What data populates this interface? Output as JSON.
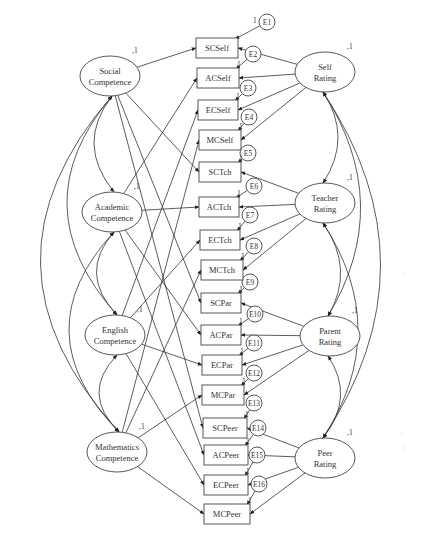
{
  "diagram": {
    "type": "structural-equation-model",
    "latent_left": [
      {
        "id": "SC",
        "line1": "Social",
        "line2": "Competence",
        "variance": ",1",
        "cx": 110,
        "cy": 76
      },
      {
        "id": "AC",
        "line1": "Academic",
        "line2": "Competence",
        "variance": ",1",
        "cx": 112,
        "cy": 212
      },
      {
        "id": "EC",
        "line1": "English",
        "line2": "Competence",
        "variance": ",1",
        "cx": 115,
        "cy": 335
      },
      {
        "id": "MC",
        "line1": "Mathematics",
        "line2": "Competence",
        "variance": ",1",
        "cx": 117,
        "cy": 452
      }
    ],
    "latent_right": [
      {
        "id": "SR",
        "line1": "Self",
        "line2": "Rating",
        "variance": ",1",
        "cx": 325,
        "cy": 72
      },
      {
        "id": "TR",
        "line1": "Teacher",
        "line2": "Rating",
        "variance": ",1",
        "cx": 325,
        "cy": 203
      },
      {
        "id": "PR",
        "line1": "Parent",
        "line2": "Rating",
        "variance": ",1",
        "cx": 330,
        "cy": 336
      },
      {
        "id": "PE",
        "line1": "Peer",
        "line2": "Rating",
        "variance": ",1",
        "cx": 325,
        "cy": 458
      }
    ],
    "indicators": [
      {
        "label": "SCSelf",
        "error": "E1",
        "trait": 0,
        "method": 0
      },
      {
        "label": "ACSelf",
        "error": "E2",
        "trait": 1,
        "method": 0
      },
      {
        "label": "ECSelf",
        "error": "E3",
        "trait": 2,
        "method": 0
      },
      {
        "label": "MCSelf",
        "error": "E4",
        "trait": 3,
        "method": 0
      },
      {
        "label": "SCTch",
        "error": "E5",
        "trait": 0,
        "method": 1
      },
      {
        "label": "ACTch",
        "error": "E6",
        "trait": 1,
        "method": 1
      },
      {
        "label": "ECTch",
        "error": "E7",
        "trait": 2,
        "method": 1
      },
      {
        "label": "MCTch",
        "error": "E8",
        "trait": 3,
        "method": 1
      },
      {
        "label": "SCPar",
        "error": "E9",
        "trait": 0,
        "method": 2
      },
      {
        "label": "ACPar",
        "error": "E10",
        "trait": 1,
        "method": 2
      },
      {
        "label": "ECPar",
        "error": "E11",
        "trait": 2,
        "method": 2
      },
      {
        "label": "MCPar",
        "error": "E12",
        "trait": 3,
        "method": 2
      },
      {
        "label": "SCPeer",
        "error": "E13",
        "trait": 0,
        "method": 3
      },
      {
        "label": "ACPeer",
        "error": "E14",
        "trait": 1,
        "method": 3
      },
      {
        "label": "ECPeer",
        "error": "E15",
        "trait": 2,
        "method": 3
      },
      {
        "label": "MCPeer",
        "error": "E16",
        "trait": 3,
        "method": 3
      }
    ],
    "error_path_label": "1",
    "side_marks": [
      "a.",
      "c.",
      "d."
    ]
  }
}
